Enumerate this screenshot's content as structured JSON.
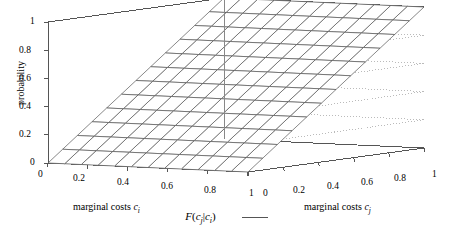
{
  "chart_data": {
    "type": "surface",
    "title": "",
    "xlabel": "marginal costs c_i",
    "ylabel_right": "marginal costs c_j",
    "zlabel": "probability",
    "xlim": [
      0,
      1
    ],
    "ylim": [
      0,
      1
    ],
    "zlim": [
      0,
      1
    ],
    "grid": true,
    "grid_style": "dotted",
    "legend_position": "bottom-center",
    "mesh_divisions": 12,
    "series": [
      {
        "name": "F (c_j|c_i)",
        "surface_function": "F(c_j|c_i) = c_j, a ruled planar surface rising linearly in c_j and independent of c_i",
        "z_values_corners": {
          "ci0_cj0": 0,
          "ci1_cj0": 0,
          "ci0_cj1": 1,
          "ci1_cj1": 1
        },
        "line_color": "#555555"
      }
    ],
    "x_ticks": [
      0,
      0.2,
      0.4,
      0.6,
      0.8,
      1
    ],
    "y_ticks": [
      0,
      0.2,
      0.4,
      0.6,
      0.8,
      1
    ],
    "z_ticks": [
      0,
      0.2,
      0.4,
      0.6,
      0.8,
      1
    ]
  },
  "axes": {
    "z": {
      "title": "probability",
      "ticks": [
        "0",
        "0.2",
        "0.4",
        "0.6",
        "0.8",
        "1"
      ]
    },
    "x_left": {
      "title_text": "marginal costs",
      "title_var": "c",
      "title_sub": "i",
      "ticks": [
        "0",
        "0.2",
        "0.4",
        "0.6",
        "0.8",
        "1"
      ]
    },
    "y_right": {
      "title_text": "marginal costs",
      "title_var": "c",
      "title_sub": "j",
      "ticks": [
        "0",
        "0.2",
        "0.4",
        "0.6",
        "0.8",
        "1"
      ]
    }
  },
  "legend": {
    "entries": [
      {
        "label_f": "F",
        "label_open": "(",
        "label_cj": "c",
        "label_cj_sub": "j",
        "label_bar": "|",
        "label_ci": "c",
        "label_ci_sub": "i",
        "label_close": ")",
        "swatch": "line-swatch"
      }
    ]
  },
  "colors": {
    "background": "#ffffff",
    "axis_line": "#555555",
    "grid_line": "#bbbbbb",
    "mesh_line": "#555555",
    "text": "#000000"
  }
}
